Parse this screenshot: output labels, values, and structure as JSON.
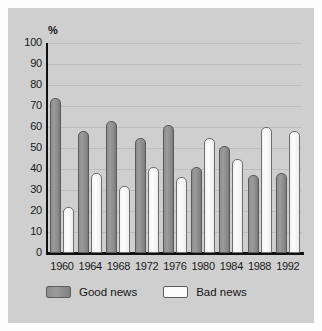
{
  "chart_data": {
    "type": "bar",
    "title": "",
    "xlabel": "",
    "ylabel": "%",
    "ylim": [
      0,
      100
    ],
    "ytick_step": 10,
    "grid": true,
    "legend_position": "bottom-left",
    "categories": [
      "1960",
      "1964",
      "1968",
      "1972",
      "1976",
      "1980",
      "1984",
      "1988",
      "1992"
    ],
    "series": [
      {
        "name": "Good news",
        "color": "#909090",
        "values": [
          74,
          58,
          63,
          55,
          61,
          41,
          51,
          37,
          38
        ]
      },
      {
        "name": "Bad news",
        "color": "#fbfbfb",
        "values": [
          22,
          38,
          32,
          41,
          36,
          55,
          45,
          60,
          58
        ]
      }
    ],
    "ytick_labels": [
      "100",
      "90",
      "80",
      "70",
      "60",
      "50",
      "40",
      "30",
      "20",
      "10",
      "0"
    ]
  },
  "axis": {
    "unit_label": "%"
  },
  "legend": {
    "items": [
      {
        "label": "Good news",
        "swatch": "good"
      },
      {
        "label": "Bad news",
        "swatch": "bad"
      }
    ]
  }
}
